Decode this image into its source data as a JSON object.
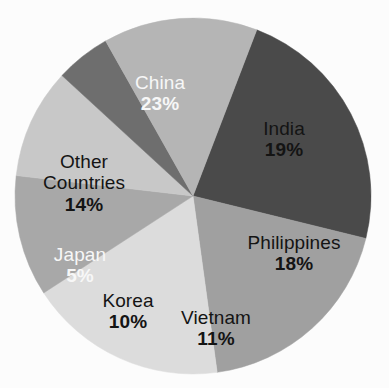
{
  "chart_data": {
    "type": "pie",
    "title": "",
    "subtitle": "",
    "xlabel": "",
    "ylabel": "",
    "legend": "none",
    "grid": false,
    "labels_inside_slices": true,
    "start_angle_deg": 21,
    "direction": "clockwise",
    "categories": [
      "China",
      "India",
      "Philippines",
      "Vietnam",
      "Korea",
      "Japan",
      "Other Countries"
    ],
    "values": [
      23,
      19,
      18,
      11,
      10,
      5,
      14
    ],
    "value_unit": "%",
    "value_labels": [
      "23%",
      "19%",
      "18%",
      "11%",
      "10%",
      "5%",
      "14%"
    ],
    "slice_colors": [
      "#4a4a4a",
      "#a0a0a0",
      "#dcdcdc",
      "#a8a8a8",
      "#c8c8c8",
      "#6e6e6e",
      "#b5b5b5"
    ],
    "slices": [
      {
        "name": "China",
        "value": 23,
        "value_label": "23%",
        "color": "#4a4a4a",
        "text_color": "#f7f7f7",
        "label_x": 160,
        "label_y": 93
      },
      {
        "name": "India",
        "value": 19,
        "value_label": "19%",
        "color": "#a0a0a0",
        "text_color": "#141414",
        "label_x": 284,
        "label_y": 139
      },
      {
        "name": "Philippines",
        "value": 18,
        "value_label": "18%",
        "color": "#dcdcdc",
        "text_color": "#141414",
        "label_x": 294,
        "label_y": 253
      },
      {
        "name": "Vietnam",
        "value": 11,
        "value_label": "11%",
        "color": "#a8a8a8",
        "text_color": "#141414",
        "label_x": 216,
        "label_y": 328
      },
      {
        "name": "Korea",
        "value": 10,
        "value_label": "10%",
        "color": "#c8c8c8",
        "text_color": "#141414",
        "label_x": 128,
        "label_y": 311
      },
      {
        "name": "Japan",
        "value": 5,
        "value_label": "5%",
        "color": "#6e6e6e",
        "text_color": "#f7f7f7",
        "label_x": 80,
        "label_y": 265
      },
      {
        "name": "Other Countries",
        "value": 14,
        "value_label": "14%",
        "color": "#b5b5b5",
        "text_color": "#141414",
        "label_x": 84,
        "label_y": 183
      }
    ],
    "geometry": {
      "center_x": 193,
      "center_y": 196,
      "radius": 178
    },
    "background_color": "#fcfcfc"
  }
}
